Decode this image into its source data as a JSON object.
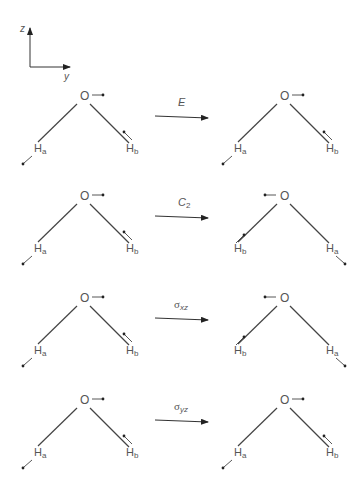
{
  "axes": {
    "vertical_label": "z",
    "horizontal_label": "y"
  },
  "atoms": {
    "oxygen": "O",
    "hydrogen": "H"
  },
  "rows": [
    {
      "operation": {
        "symbol": "E",
        "subscript": ""
      },
      "before": {
        "left_h": "a",
        "right_h": "b"
      },
      "after": {
        "left_h": "a",
        "right_h": "b"
      },
      "after_o_arrow": "right"
    },
    {
      "operation": {
        "symbol": "C",
        "subscript": "2"
      },
      "before": {
        "left_h": "a",
        "right_h": "b"
      },
      "after": {
        "left_h": "b",
        "right_h": "a"
      },
      "after_o_arrow": "left"
    },
    {
      "operation": {
        "symbol": "σ",
        "subscript": "xz"
      },
      "before": {
        "left_h": "a",
        "right_h": "b"
      },
      "after": {
        "left_h": "b",
        "right_h": "a"
      },
      "after_o_arrow": "left"
    },
    {
      "operation": {
        "symbol": "σ",
        "subscript": "yz"
      },
      "before": {
        "left_h": "a",
        "right_h": "b"
      },
      "after": {
        "left_h": "a",
        "right_h": "b"
      },
      "after_o_arrow": "right"
    }
  ]
}
